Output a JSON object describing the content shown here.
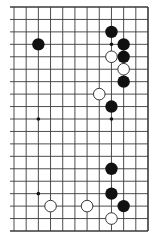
{
  "diagram": {
    "type": "go-board-fragment",
    "visible_columns": 12,
    "visible_rows": 19,
    "edges": [
      "top",
      "right",
      "bottom"
    ],
    "colors": {
      "background": "#ffffff",
      "grid": "#3a3a3a",
      "black_stone": "#111111",
      "white_stone_fill": "#ffffff",
      "white_stone_stroke": "#222222"
    },
    "star_points": [
      [
        8,
        3
      ],
      [
        2,
        9
      ],
      [
        8,
        9
      ],
      [
        2,
        15
      ]
    ],
    "stones": [
      {
        "color": "black",
        "col": 2,
        "row": 3
      },
      {
        "color": "black",
        "col": 8,
        "row": 2
      },
      {
        "color": "black",
        "col": 9,
        "row": 3
      },
      {
        "color": "black",
        "col": 9,
        "row": 4
      },
      {
        "color": "white",
        "col": 8,
        "row": 4
      },
      {
        "color": "white",
        "col": 9,
        "row": 5
      },
      {
        "color": "black",
        "col": 9,
        "row": 6
      },
      {
        "color": "white",
        "col": 7,
        "row": 7
      },
      {
        "color": "black",
        "col": 8,
        "row": 8
      },
      {
        "color": "black",
        "col": 8,
        "row": 13
      },
      {
        "color": "black",
        "col": 8,
        "row": 15
      },
      {
        "color": "black",
        "col": 9,
        "row": 16
      },
      {
        "color": "white",
        "col": 8,
        "row": 17
      },
      {
        "color": "white",
        "col": 3,
        "row": 16
      },
      {
        "color": "white",
        "col": 6,
        "row": 16
      }
    ]
  }
}
